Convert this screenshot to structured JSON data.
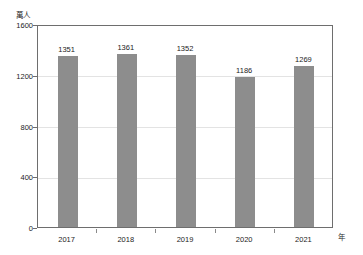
{
  "chart_data": {
    "type": "bar",
    "title": "",
    "subtitle": "",
    "xlabel": "年",
    "ylabel": "萬人",
    "categories": [
      "2017",
      "2018",
      "2019",
      "2020",
      "2021"
    ],
    "values": [
      1351,
      1361,
      1352,
      1186,
      1269
    ],
    "data_labels": [
      "1351",
      "1361",
      "1352",
      "1186",
      "1269"
    ],
    "ylim": [
      0,
      1600
    ],
    "ytick_values": [
      0,
      400,
      800,
      1200,
      1600
    ],
    "ytick_labels": [
      "0",
      "400",
      "800",
      "1200",
      "1600"
    ],
    "grid": true,
    "grid_axis": "y",
    "legend": false,
    "legend_position": "none",
    "series": [
      {
        "name": "",
        "values": [
          1351,
          1361,
          1352,
          1186,
          1269
        ],
        "color": "#8d8d8d"
      }
    ],
    "colors": {
      "bar": "#8d8d8d",
      "frame": "#6e6e6e",
      "grid": "#e3e3e3",
      "text": "#1c1c1c",
      "background": "#ffffff"
    }
  }
}
